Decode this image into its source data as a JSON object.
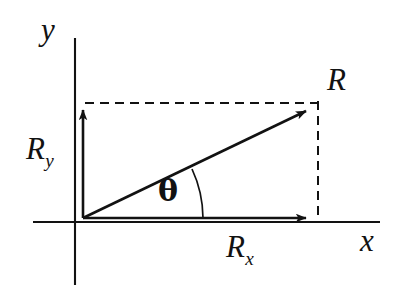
{
  "figure": {
    "type": "vector-decomposition-diagram",
    "background_color": "#ffffff",
    "stroke_color": "#121212"
  },
  "axes": {
    "x_axis": {
      "label": "x",
      "label_position": {
        "x": 360,
        "y": 225
      },
      "line": {
        "x1": 33,
        "y1": 222,
        "x2": 380,
        "y2": 222
      }
    },
    "y_axis": {
      "label": "y",
      "label_position": {
        "x": 41,
        "y": 14
      },
      "line": {
        "x1": 75,
        "y1": 38,
        "x2": 75,
        "y2": 285
      }
    },
    "origin": {
      "x": 83,
      "y": 218
    }
  },
  "vectors": [
    {
      "name": "resultant",
      "label": "R",
      "label_subscript": "",
      "label_position": {
        "x": 327,
        "y": 64
      },
      "from": {
        "x": 83,
        "y": 218
      },
      "to": {
        "x": 313,
        "y": 107
      },
      "style": "solid-arrow"
    },
    {
      "name": "y-component",
      "label": "R",
      "label_subscript": "y",
      "label_position": {
        "x": 26,
        "y": 133
      },
      "from": {
        "x": 83,
        "y": 218
      },
      "to": {
        "x": 83,
        "y": 103
      },
      "style": "solid-arrow"
    },
    {
      "name": "x-component",
      "label": "R",
      "label_subscript": "x",
      "label_position": {
        "x": 226,
        "y": 231
      },
      "from": {
        "x": 83,
        "y": 218
      },
      "to": {
        "x": 313,
        "y": 218
      },
      "style": "solid-arrow"
    }
  ],
  "angle": {
    "label": "θ",
    "label_position": {
      "x": 158,
      "y": 176
    },
    "vertex": {
      "x": 83,
      "y": 218
    },
    "between": [
      "x-component",
      "resultant"
    ],
    "arc_radius": 120
  },
  "construction_lines": [
    {
      "name": "top-dashed-guide",
      "style": "dashed",
      "from": {
        "x": 85,
        "y": 103
      },
      "to": {
        "x": 318,
        "y": 103
      }
    },
    {
      "name": "right-dashed-guide",
      "style": "dashed",
      "from": {
        "x": 318,
        "y": 101
      },
      "to": {
        "x": 318,
        "y": 220
      }
    }
  ]
}
